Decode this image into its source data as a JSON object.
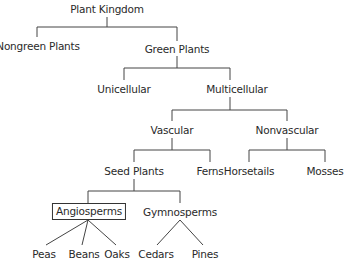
{
  "title": "Plant Kingdom",
  "line_color": "#444444",
  "nodes": {
    "root": {
      "label": "Plant Kingdom",
      "x": 107,
      "y": 3
    },
    "nongreen": {
      "label": "Nongreen Plants",
      "x": 38,
      "y": 40
    },
    "green": {
      "label": "Green Plants",
      "x": 177,
      "y": 43
    },
    "unicellular": {
      "label": "Unicellular",
      "x": 124,
      "y": 83
    },
    "multicellular": {
      "label": "Multicellular",
      "x": 237,
      "y": 83
    },
    "vascular": {
      "label": "Vascular",
      "x": 172,
      "y": 124
    },
    "nonvascular": {
      "label": "Nonvascular",
      "x": 287,
      "y": 124
    },
    "seed_plants": {
      "label": "Seed Plants",
      "x": 134,
      "y": 165
    },
    "ferns": {
      "label": "Ferns",
      "x": 210,
      "y": 165
    },
    "horsetails": {
      "label": "Horsetails",
      "x": 249,
      "y": 165
    },
    "mosses": {
      "label": "Mosses",
      "x": 325,
      "y": 165
    },
    "angiosperms": {
      "label": "Angiosperms",
      "x": 89,
      "y": 204,
      "highlighted": true
    },
    "gymnosperms": {
      "label": "Gymnosperms",
      "x": 180,
      "y": 206
    },
    "peas": {
      "label": "Peas",
      "x": 46,
      "y": 248
    },
    "beans": {
      "label": "Beans",
      "x": 86,
      "y": 248
    },
    "oaks": {
      "label": "Oaks",
      "x": 113,
      "y": 248
    },
    "cedars": {
      "label": "Cedars",
      "x": 157,
      "y": 248
    },
    "pines": {
      "label": "Pines",
      "x": 205,
      "y": 248
    }
  },
  "edges": [
    [
      "root",
      "nongreen"
    ],
    [
      "root",
      "green"
    ],
    [
      "green",
      "unicellular"
    ],
    [
      "green",
      "multicellular"
    ],
    [
      "multicellular",
      "vascular"
    ],
    [
      "multicellular",
      "nonvascular"
    ],
    [
      "vascular",
      "seed_plants"
    ],
    [
      "vascular",
      "ferns"
    ],
    [
      "nonvascular",
      "horsetails"
    ],
    [
      "nonvascular",
      "mosses"
    ],
    [
      "seed_plants",
      "angiosperms"
    ],
    [
      "seed_plants",
      "gymnosperms"
    ],
    [
      "angiosperms",
      "peas"
    ],
    [
      "angiosperms",
      "beans"
    ],
    [
      "angiosperms",
      "oaks"
    ],
    [
      "gymnosperms",
      "cedars"
    ],
    [
      "gymnosperms",
      "pines"
    ]
  ]
}
